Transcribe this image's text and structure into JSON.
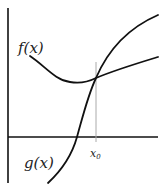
{
  "figure": {
    "type": "function-graph-sketch",
    "labels": {
      "f": "f(x)",
      "g": "g(x)",
      "x0_main": "x",
      "x0_sub": "0"
    },
    "colors": {
      "stroke": "#111111",
      "guide": "#aaaaaa",
      "background": "#ffffff"
    }
  }
}
